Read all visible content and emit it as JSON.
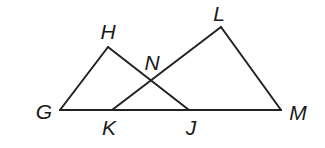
{
  "diagram": {
    "type": "geometry",
    "stroke_color": "#222222",
    "points": {
      "G": {
        "label": "G",
        "x": 60,
        "y": 110,
        "lx": 44,
        "ly": 111
      },
      "H": {
        "label": "H",
        "x": 108,
        "y": 47,
        "lx": 108,
        "ly": 31
      },
      "J": {
        "label": "J",
        "x": 189,
        "y": 110,
        "lx": 191,
        "ly": 127
      },
      "K": {
        "label": "K",
        "x": 112,
        "y": 110,
        "lx": 109,
        "ly": 127
      },
      "L": {
        "label": "L",
        "x": 221,
        "y": 27,
        "lx": 219,
        "ly": 13
      },
      "M": {
        "label": "M",
        "x": 281,
        "y": 110,
        "lx": 298,
        "ly": 112
      },
      "N": {
        "label": "N",
        "x": 151,
        "y": 80,
        "lx": 152,
        "ly": 62
      }
    },
    "segments": [
      {
        "name": "segment-GH",
        "from": "G",
        "to": "H"
      },
      {
        "name": "segment-HJ",
        "from": "H",
        "to": "J"
      },
      {
        "name": "segment-KL",
        "from": "K",
        "to": "L"
      },
      {
        "name": "segment-LM",
        "from": "L",
        "to": "M"
      },
      {
        "name": "segment-GM",
        "from": "G",
        "to": "M"
      }
    ],
    "triangles": [
      "GHJ",
      "KLM"
    ],
    "intersection": {
      "point": "N",
      "of": [
        "HJ",
        "KL"
      ]
    },
    "collinear": [
      "G",
      "K",
      "J",
      "M"
    ]
  }
}
